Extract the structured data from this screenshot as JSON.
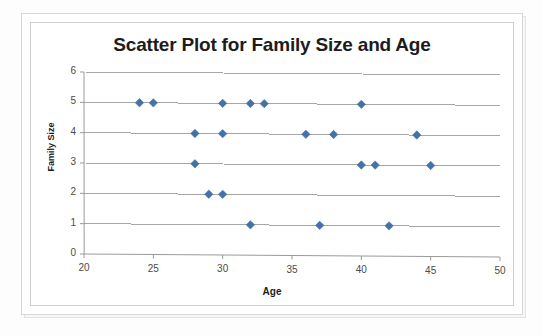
{
  "chart_data": {
    "type": "scatter",
    "title": "Scatter Plot for Family Size and Age",
    "xlabel": "Age",
    "ylabel": "Family Size",
    "xlim": [
      20,
      50
    ],
    "ylim": [
      0,
      6
    ],
    "xticks": [
      20,
      25,
      30,
      35,
      40,
      45,
      50
    ],
    "yticks": [
      0,
      1,
      2,
      3,
      4,
      5,
      6
    ],
    "grid": "horizontal",
    "legend": "none",
    "marker": "diamond",
    "marker_color": "#4472a8",
    "series": [
      {
        "name": "Family Size vs Age",
        "x": [
          24,
          25,
          30,
          32,
          33,
          40,
          28,
          30,
          36,
          38,
          44,
          28,
          40,
          41,
          45,
          29,
          30,
          32,
          37,
          42
        ],
        "y": [
          5,
          5,
          5,
          5,
          5,
          5,
          4,
          4,
          4,
          4,
          4,
          3,
          3,
          3,
          3,
          2,
          2,
          1,
          1,
          1
        ]
      }
    ]
  },
  "figure": {
    "background_color": "#ffffff",
    "frame_color": "#cfcfcf",
    "axis_color": "#9a9a9a",
    "gridline_color": "#a6a6a6",
    "title_color": "#1c1c1c"
  }
}
